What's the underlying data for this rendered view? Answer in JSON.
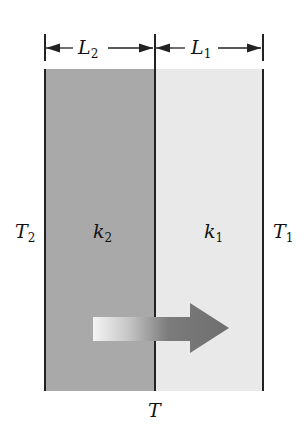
{
  "diagram": {
    "dimensions": [
      {
        "symbol": "L",
        "subscript": "2"
      },
      {
        "symbol": "L",
        "subscript": "1"
      }
    ],
    "layers": [
      {
        "symbol": "k",
        "subscript": "2",
        "color": "#a9a9a9"
      },
      {
        "symbol": "k",
        "subscript": "1",
        "color": "#e9e9e9"
      }
    ],
    "temperatures": {
      "left": {
        "symbol": "T",
        "subscript": "2"
      },
      "right": {
        "symbol": "T",
        "subscript": "1"
      },
      "interface": {
        "symbol": "T"
      }
    },
    "arrow": {
      "direction": "right",
      "meaning": "heat-flow"
    }
  }
}
